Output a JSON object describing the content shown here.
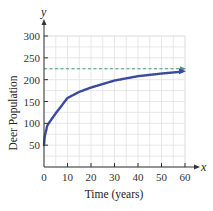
{
  "chart_data": {
    "type": "line",
    "title": "",
    "xlabel": "Time (years)",
    "ylabel": "Deer Population",
    "x_axis_letter": "x",
    "y_axis_letter": "y",
    "xlim": [
      0,
      60
    ],
    "ylim": [
      0,
      300
    ],
    "x_ticks": [
      "0",
      "10",
      "20",
      "30",
      "40",
      "50",
      "60"
    ],
    "y_ticks": [
      "50",
      "100",
      "150",
      "200",
      "250",
      "300"
    ],
    "grid": true,
    "series": [
      {
        "name": "Deer population",
        "color": "#3b4a9c",
        "x": [
          0,
          1,
          2,
          5,
          10,
          15,
          20,
          30,
          40,
          50,
          60
        ],
        "values": [
          50,
          85,
          100,
          123,
          158,
          172,
          182,
          198,
          208,
          214,
          219
        ]
      }
    ],
    "annotations": [
      {
        "type": "horizontal-asymptote",
        "y": 225,
        "style": "dashed",
        "color": "#4e9b7f"
      }
    ]
  }
}
